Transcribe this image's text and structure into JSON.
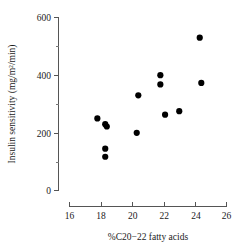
{
  "chart_data": {
    "type": "scatter",
    "title": "",
    "xlabel": "%C20−22 fatty acids",
    "ylabel": "Insulin sensitivity (mg/m²/min)",
    "xlim": [
      16,
      26
    ],
    "ylim": [
      0,
      600
    ],
    "xticks": [
      16,
      18,
      20,
      22,
      24,
      26
    ],
    "xtick_labels": [
      "16",
      "18",
      "20",
      "22",
      "24",
      "26"
    ],
    "yticks": [
      0,
      200,
      400,
      600
    ],
    "ytick_labels": [
      "0",
      "200",
      "400",
      "600"
    ],
    "yticks_minor": [
      100,
      300,
      500
    ],
    "grid": false,
    "legend": null,
    "marker": "filled-circle",
    "marker_color": "#000000",
    "series": [
      {
        "name": "subjects",
        "points": [
          {
            "x": 17.8,
            "y": 250
          },
          {
            "x": 18.3,
            "y": 230
          },
          {
            "x": 18.4,
            "y": 222
          },
          {
            "x": 18.3,
            "y": 145
          },
          {
            "x": 18.3,
            "y": 117
          },
          {
            "x": 20.3,
            "y": 200
          },
          {
            "x": 20.4,
            "y": 330
          },
          {
            "x": 21.8,
            "y": 400
          },
          {
            "x": 21.8,
            "y": 368
          },
          {
            "x": 22.1,
            "y": 263
          },
          {
            "x": 23.0,
            "y": 275
          },
          {
            "x": 24.3,
            "y": 530
          },
          {
            "x": 24.4,
            "y": 373
          }
        ]
      }
    ]
  },
  "axes": {
    "x_title": "%C20−22 fatty acids",
    "y_title": "Insulin sensitivity (mg/m²/min)",
    "x_tick_labels": [
      "16",
      "18",
      "20",
      "22",
      "24",
      "26"
    ],
    "y_tick_labels": [
      "0",
      "200",
      "400",
      "600"
    ]
  }
}
